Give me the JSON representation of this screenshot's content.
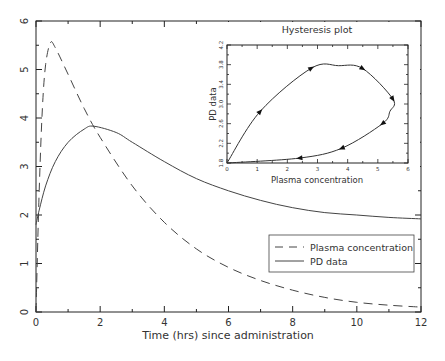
{
  "chart_data": [
    {
      "type": "line",
      "title": "",
      "xlabel": "Time (hrs) since administration",
      "ylabel": "",
      "xlim": [
        0,
        12
      ],
      "ylim": [
        0,
        6
      ],
      "xticks": [
        0,
        2,
        4,
        6,
        8,
        10,
        12
      ],
      "yticks": [
        0,
        1,
        2,
        3,
        4,
        5,
        6
      ],
      "grid": false,
      "legend_position": "lower right",
      "series": [
        {
          "name": "Plasma concentration",
          "style": "dashed",
          "x": [
            0,
            0.1,
            0.2,
            0.3,
            0.45,
            0.6,
            1,
            1.5,
            2,
            3,
            4,
            5,
            6,
            7,
            8,
            9,
            10,
            11,
            12
          ],
          "y": [
            0,
            2.5,
            4.2,
            5.1,
            5.55,
            5.45,
            4.9,
            4.2,
            3.6,
            2.6,
            1.85,
            1.3,
            0.92,
            0.65,
            0.45,
            0.3,
            0.2,
            0.14,
            0.1
          ]
        },
        {
          "name": "PD data",
          "style": "solid",
          "x": [
            0,
            0.1,
            0.3,
            0.6,
            1,
            1.5,
            1.8,
            2.5,
            3,
            4,
            5,
            6,
            7,
            8,
            9,
            10,
            11,
            12
          ],
          "y": [
            1.8,
            2.1,
            2.6,
            3.1,
            3.5,
            3.77,
            3.83,
            3.7,
            3.5,
            3.1,
            2.75,
            2.5,
            2.3,
            2.15,
            2.05,
            2.0,
            1.95,
            1.92
          ]
        }
      ]
    },
    {
      "type": "line",
      "title": "Hysteresis plot",
      "xlabel": "Plasma concentration",
      "ylabel": "PD data",
      "xlim": [
        0,
        6
      ],
      "ylim": [
        1.8,
        4.2
      ],
      "xticks": [
        0,
        1,
        2,
        3,
        4,
        5,
        6
      ],
      "yticks": [
        1.8,
        2.2,
        2.6,
        3.0,
        3.4,
        3.8,
        4.2
      ],
      "grid": false,
      "series": [
        {
          "name": "Hysteresis loop",
          "style": "solid with direction arrows",
          "x": [
            0,
            1.1,
            2.8,
            3.7,
            4.5,
            5.5,
            5.4,
            5.15,
            3.8,
            2.4,
            0
          ],
          "y": [
            1.8,
            2.85,
            3.73,
            3.78,
            3.72,
            3.1,
            2.85,
            2.6,
            2.1,
            1.9,
            1.8
          ]
        }
      ]
    }
  ]
}
